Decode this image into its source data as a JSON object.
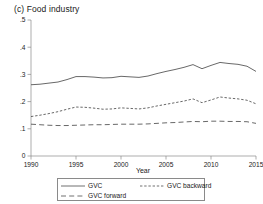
{
  "figure": {
    "panel_label": "(c)",
    "title": "(c)  Food industry"
  },
  "chart_data": {
    "type": "line",
    "title": "(c)  Food industry",
    "xlabel": "Year",
    "ylabel": "",
    "xlim": [
      1990,
      2015
    ],
    "ylim": [
      0,
      0.5
    ],
    "grid": false,
    "legend_position": "below-axis",
    "xticks": [
      1990,
      1995,
      2000,
      2005,
      2010,
      2015
    ],
    "xticklabels": [
      "1990",
      "1995",
      "2000",
      "2005",
      "2010",
      "2015"
    ],
    "yticks": [
      0,
      0.1,
      0.2,
      0.3,
      0.4,
      0.5
    ],
    "yticklabels": [
      "0",
      ".1",
      ".2",
      ".3",
      ".4",
      ".5"
    ],
    "x": [
      1990,
      1991,
      1992,
      1993,
      1994,
      1995,
      1996,
      1997,
      1998,
      1999,
      2000,
      2001,
      2002,
      2003,
      2004,
      2005,
      2006,
      2007,
      2008,
      2009,
      2010,
      2011,
      2012,
      2013,
      2014,
      2015
    ],
    "series": [
      {
        "name": "GVC",
        "style": "solid",
        "color": "#4d4d4d",
        "values": [
          0.262,
          0.264,
          0.268,
          0.272,
          0.281,
          0.292,
          0.292,
          0.29,
          0.287,
          0.288,
          0.293,
          0.291,
          0.289,
          0.294,
          0.303,
          0.311,
          0.318,
          0.326,
          0.336,
          0.321,
          0.333,
          0.344,
          0.34,
          0.337,
          0.33,
          0.311
        ]
      },
      {
        "name": "GVC backward",
        "style": "dotted",
        "color": "#4d4d4d",
        "values": [
          0.145,
          0.15,
          0.156,
          0.163,
          0.172,
          0.18,
          0.179,
          0.176,
          0.172,
          0.173,
          0.177,
          0.175,
          0.173,
          0.177,
          0.184,
          0.19,
          0.196,
          0.202,
          0.21,
          0.196,
          0.206,
          0.217,
          0.213,
          0.21,
          0.205,
          0.192
        ]
      },
      {
        "name": "GVC forward",
        "style": "dashed",
        "color": "#4d4d4d",
        "values": [
          0.117,
          0.115,
          0.113,
          0.112,
          0.112,
          0.113,
          0.114,
          0.115,
          0.115,
          0.116,
          0.117,
          0.117,
          0.117,
          0.118,
          0.12,
          0.122,
          0.123,
          0.125,
          0.127,
          0.126,
          0.128,
          0.128,
          0.127,
          0.127,
          0.126,
          0.12
        ]
      }
    ],
    "legend": [
      {
        "label": "GVC",
        "style": "solid"
      },
      {
        "label": "GVC backward",
        "style": "dotted"
      },
      {
        "label": "GVC forward",
        "style": "dashed"
      }
    ]
  }
}
